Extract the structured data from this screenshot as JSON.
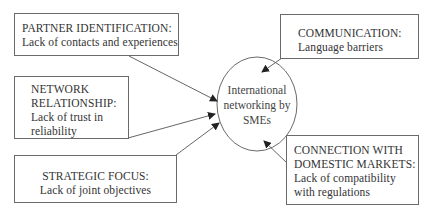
{
  "diagram": {
    "center": {
      "lines": [
        "International",
        "networking",
        "by SMEs"
      ]
    },
    "nodes": [
      {
        "id": "partner",
        "title": "PARTNER IDENTIFICATION:",
        "lines": [
          "Lack of contacts and experiences"
        ]
      },
      {
        "id": "network",
        "title_lines": [
          "NETWORK",
          "RELATIONSHIP:"
        ],
        "lines": [
          "Lack of trust in",
          "reliability"
        ]
      },
      {
        "id": "strategic",
        "title": "STRATEGIC FOCUS:",
        "lines": [
          "Lack of joint objectives"
        ]
      },
      {
        "id": "communication",
        "title": "COMMUNICATION:",
        "lines": [
          "Language barriers"
        ]
      },
      {
        "id": "connection",
        "title_lines": [
          "CONNECTION WITH",
          "DOMESTIC MARKETS:"
        ],
        "lines": [
          "Lack of compatibility",
          "with regulations"
        ]
      }
    ],
    "edges": [
      {
        "from": "partner",
        "to": "center"
      },
      {
        "from": "network",
        "to": "center"
      },
      {
        "from": "strategic",
        "to": "center"
      },
      {
        "from": "communication",
        "to": "center"
      },
      {
        "from": "connection",
        "to": "center"
      }
    ],
    "colors": {
      "stroke": "#6a6a6a",
      "text": "#333333",
      "background": "#ffffff"
    }
  }
}
